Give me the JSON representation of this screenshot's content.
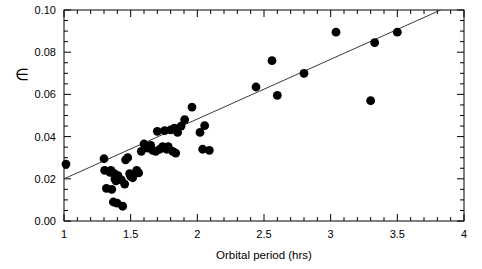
{
  "chart_data": {
    "type": "scatter",
    "title": "",
    "xlabel": "Orbital period (hrs)",
    "ylabel": "∈",
    "xlim": [
      1,
      4
    ],
    "ylim": [
      0.0,
      0.1
    ],
    "grid": false,
    "legend": "none",
    "x_ticks_major": [
      1,
      1.5,
      2,
      2.5,
      3,
      3.5,
      4
    ],
    "x_tick_labels": [
      "1",
      "1.5",
      "2",
      "2.5",
      "3",
      "3.5",
      "4"
    ],
    "x_minor_step": 0.1,
    "y_ticks_major": [
      0.0,
      0.02,
      0.04,
      0.06,
      0.08,
      0.1
    ],
    "y_tick_labels": [
      "0.00",
      "0.02",
      "0.04",
      "0.06",
      "0.08",
      "0.10"
    ],
    "y_minor_step": 0.005,
    "marker": "filled-circle",
    "marker_color": "#000000",
    "marker_size": 4.4,
    "series": [
      {
        "name": "observations",
        "points": [
          [
            1.015,
            0.027
          ],
          [
            1.3,
            0.0295
          ],
          [
            1.305,
            0.024
          ],
          [
            1.318,
            0.0155
          ],
          [
            1.345,
            0.023
          ],
          [
            1.352,
            0.024
          ],
          [
            1.358,
            0.015
          ],
          [
            1.37,
            0.009
          ],
          [
            1.378,
            0.0225
          ],
          [
            1.382,
            0.02
          ],
          [
            1.39,
            0.019
          ],
          [
            1.398,
            0.0085
          ],
          [
            1.405,
            0.0215
          ],
          [
            1.412,
            0.02
          ],
          [
            1.43,
            0.0195
          ],
          [
            1.44,
            0.007
          ],
          [
            1.455,
            0.0175
          ],
          [
            1.462,
            0.029
          ],
          [
            1.478,
            0.03
          ],
          [
            1.492,
            0.0225
          ],
          [
            1.5,
            0.0212
          ],
          [
            1.515,
            0.0205
          ],
          [
            1.545,
            0.024
          ],
          [
            1.56,
            0.0228
          ],
          [
            1.58,
            0.033
          ],
          [
            1.6,
            0.0365
          ],
          [
            1.612,
            0.0355
          ],
          [
            1.628,
            0.0345
          ],
          [
            1.64,
            0.0352
          ],
          [
            1.65,
            0.0358
          ],
          [
            1.665,
            0.0335
          ],
          [
            1.688,
            0.033
          ],
          [
            1.7,
            0.0425
          ],
          [
            1.718,
            0.034
          ],
          [
            1.74,
            0.0352
          ],
          [
            1.755,
            0.0428
          ],
          [
            1.77,
            0.034
          ],
          [
            1.782,
            0.0352
          ],
          [
            1.8,
            0.0432
          ],
          [
            1.815,
            0.033
          ],
          [
            1.828,
            0.044
          ],
          [
            1.838,
            0.0322
          ],
          [
            1.852,
            0.042
          ],
          [
            1.878,
            0.045
          ],
          [
            1.905,
            0.048
          ],
          [
            1.96,
            0.054
          ],
          [
            2.02,
            0.042
          ],
          [
            2.04,
            0.034
          ],
          [
            2.055,
            0.0452
          ],
          [
            2.09,
            0.0335
          ],
          [
            2.44,
            0.0635
          ],
          [
            2.56,
            0.076
          ],
          [
            2.6,
            0.0595
          ],
          [
            2.8,
            0.07
          ],
          [
            3.04,
            0.0895
          ],
          [
            3.3,
            0.057
          ],
          [
            3.33,
            0.0845
          ],
          [
            3.5,
            0.0895
          ]
        ]
      }
    ],
    "fit_line": {
      "name": "linear fit",
      "color": "#3a3a3a",
      "x_start": 1.0,
      "y_start": 0.02,
      "x_end": 3.825,
      "y_end": 0.1,
      "slope": 0.0283,
      "intercept": -0.0083
    }
  }
}
